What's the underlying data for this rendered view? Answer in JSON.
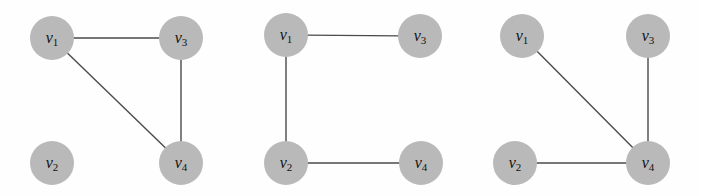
{
  "figure": {
    "node_fill_color": "#b9b9b9",
    "edge_color": "#4a4a4a",
    "background_color": "#fefefe",
    "node_radius": 22
  },
  "graphs": [
    {
      "id": "graph-1",
      "nodes": [
        {
          "id": "v1",
          "label_base": "v",
          "label_sub": "1",
          "cx": 52,
          "cy": 38
        },
        {
          "id": "v3",
          "label_base": "v",
          "label_sub": "3",
          "cx": 181,
          "cy": 38
        },
        {
          "id": "v2",
          "label_base": "v",
          "label_sub": "2",
          "cx": 52,
          "cy": 163
        },
        {
          "id": "v4",
          "label_base": "v",
          "label_sub": "4",
          "cx": 181,
          "cy": 163
        }
      ],
      "edges": [
        {
          "from": "v1",
          "to": "v3"
        },
        {
          "from": "v1",
          "to": "v4"
        },
        {
          "from": "v3",
          "to": "v4"
        }
      ]
    },
    {
      "id": "graph-2",
      "nodes": [
        {
          "id": "v1",
          "label_base": "v",
          "label_sub": "1",
          "cx": 286,
          "cy": 35
        },
        {
          "id": "v3",
          "label_base": "v",
          "label_sub": "3",
          "cx": 420,
          "cy": 36
        },
        {
          "id": "v2",
          "label_base": "v",
          "label_sub": "2",
          "cx": 286,
          "cy": 163
        },
        {
          "id": "v4",
          "label_base": "v",
          "label_sub": "4",
          "cx": 421,
          "cy": 163
        }
      ],
      "edges": [
        {
          "from": "v1",
          "to": "v3"
        },
        {
          "from": "v1",
          "to": "v2"
        },
        {
          "from": "v2",
          "to": "v4"
        }
      ]
    },
    {
      "id": "graph-3",
      "nodes": [
        {
          "id": "v1",
          "label_base": "v",
          "label_sub": "1",
          "cx": 522,
          "cy": 36
        },
        {
          "id": "v3",
          "label_base": "v",
          "label_sub": "3",
          "cx": 648,
          "cy": 36
        },
        {
          "id": "v2",
          "label_base": "v",
          "label_sub": "2",
          "cx": 515,
          "cy": 163
        },
        {
          "id": "v4",
          "label_base": "v",
          "label_sub": "4",
          "cx": 648,
          "cy": 163
        }
      ],
      "edges": [
        {
          "from": "v1",
          "to": "v4"
        },
        {
          "from": "v3",
          "to": "v4"
        },
        {
          "from": "v2",
          "to": "v4"
        }
      ]
    }
  ]
}
